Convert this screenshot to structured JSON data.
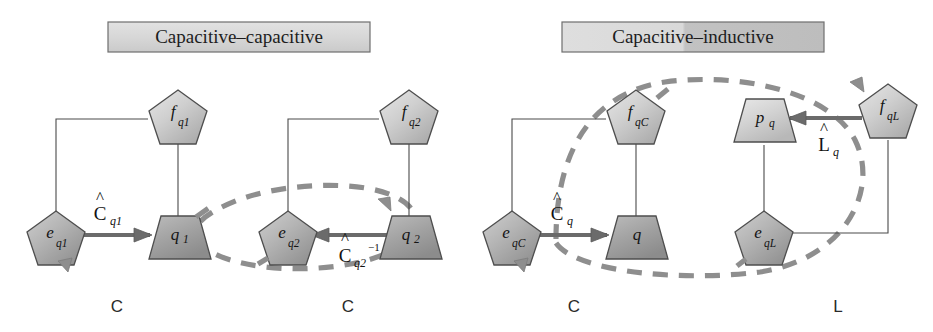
{
  "figure": {
    "background": "#ffffff",
    "accent_gray": "#8e8e8e",
    "bond_gray": "#6b6b6b",
    "outline_gray": "#4e4e4e"
  },
  "panels": [
    {
      "id": "capacitive-capacitive",
      "title": "Capacitive–capacitive",
      "title_fill_left": "#d8d8d8",
      "title_fill_right": "#d8d8d8",
      "sections": [
        {
          "id": "left-c",
          "foot_label": "C",
          "nodes": [
            {
              "id": "f-q1",
              "shape": "pentagon",
              "base": "f",
              "sub": "q1"
            },
            {
              "id": "e-q1",
              "shape": "pentagon",
              "base": "e",
              "sub": "q1"
            },
            {
              "id": "q1",
              "shape": "trapezoid",
              "base": "q",
              "sub": "1"
            }
          ],
          "gain": {
            "base": "C",
            "hat": true,
            "sub": "q1",
            "sup": ""
          }
        },
        {
          "id": "right-c",
          "foot_label": "C",
          "nodes": [
            {
              "id": "f-q2",
              "shape": "pentagon",
              "base": "f",
              "sub": "q2"
            },
            {
              "id": "e-q2",
              "shape": "pentagon",
              "base": "e",
              "sub": "q2"
            },
            {
              "id": "q2",
              "shape": "trapezoid",
              "base": "q",
              "sub": "2"
            }
          ],
          "gain": {
            "base": "C",
            "hat": true,
            "sub": "q2",
            "sup": "−1"
          }
        }
      ]
    },
    {
      "id": "capacitive-inductive",
      "title": "Capacitive–inductive",
      "title_fill_left": "#dcdcdc",
      "title_fill_right": "#bfbfbf",
      "sections": [
        {
          "id": "left-c2",
          "foot_label": "C",
          "nodes": [
            {
              "id": "f-qC",
              "shape": "pentagon",
              "base": "f",
              "sub": "qC"
            },
            {
              "id": "e-qC",
              "shape": "pentagon",
              "base": "e",
              "sub": "qC"
            },
            {
              "id": "q",
              "shape": "trapezoid",
              "base": "q",
              "sub": ""
            }
          ],
          "gain": {
            "base": "C",
            "hat": true,
            "sub": "q",
            "sup": ""
          }
        },
        {
          "id": "right-l",
          "foot_label": "L",
          "nodes": [
            {
              "id": "f-qL",
              "shape": "pentagon",
              "base": "f",
              "sub": "qL"
            },
            {
              "id": "e-qL",
              "shape": "pentagon",
              "base": "e",
              "sub": "qL"
            },
            {
              "id": "p-q",
              "shape": "trapezoid",
              "base": "p",
              "sub": "q"
            }
          ],
          "gain": {
            "base": "L",
            "hat": true,
            "sub": "q",
            "sup": ""
          }
        }
      ]
    }
  ]
}
